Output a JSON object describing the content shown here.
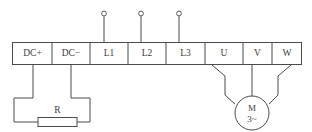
{
  "diagram": {
    "terminal_strip": {
      "terminals": [
        {
          "id": "dcplus",
          "label": "DC+",
          "x_center": 33,
          "group": "dc-bus"
        },
        {
          "id": "dcminus",
          "label": "DC−",
          "x_center": 71,
          "group": "dc-bus"
        },
        {
          "id": "l1",
          "label": "L1",
          "x_center": 109,
          "group": "mains-input"
        },
        {
          "id": "l2",
          "label": "L2",
          "x_center": 147,
          "group": "mains-input"
        },
        {
          "id": "l3",
          "label": "L3",
          "x_center": 186,
          "group": "mains-input"
        },
        {
          "id": "u",
          "label": "U",
          "x_center": 224,
          "group": "motor-output"
        },
        {
          "id": "v",
          "label": "V",
          "x_center": 263,
          "group": "motor-output"
        },
        {
          "id": "w",
          "label": "W",
          "x_center": 289,
          "group": "motor-output"
        }
      ]
    },
    "motor": {
      "label_top": "M",
      "label_bottom": "3~"
    },
    "braking_resistor": {
      "label": "R"
    },
    "supply_nodes": [
      {
        "for": "l1",
        "shape": "open-circle"
      },
      {
        "for": "l2",
        "shape": "open-circle"
      },
      {
        "for": "l3",
        "shape": "open-circle"
      }
    ],
    "colors": {
      "line": "#4b4b4b",
      "text": "#3d3d3d",
      "background": "#ffffff"
    }
  }
}
